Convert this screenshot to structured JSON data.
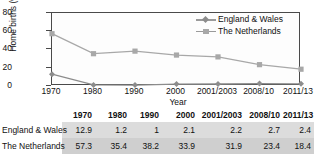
{
  "chart_data": {
    "type": "line",
    "title": "",
    "xlabel": "Year",
    "ylabel": "Home births (%)",
    "categories": [
      "1970",
      "1980",
      "1990",
      "2000",
      "2001/2003",
      "2008/10",
      "2011/13"
    ],
    "ylim": [
      0,
      80
    ],
    "yticks": [
      "0",
      "20",
      "40",
      "60",
      "80"
    ],
    "grid": false,
    "legend_position": "top-right",
    "series": [
      {
        "name": "England & Wales",
        "marker": "diamond",
        "color": "#8c8c8c",
        "values": [
          12.9,
          1.2,
          1,
          2.1,
          2.2,
          2.7,
          2.4
        ]
      },
      {
        "name": "The Netherlands",
        "marker": "square",
        "color": "#a8a8a8",
        "values": [
          57.3,
          35.4,
          38.2,
          33.9,
          31.9,
          23.4,
          18.4
        ]
      }
    ]
  },
  "legend": {
    "items": [
      {
        "label": "England & Wales"
      },
      {
        "label": "The Netherlands"
      }
    ]
  },
  "table": {
    "columns": [
      "1970",
      "1980",
      "1990",
      "2000",
      "2001/2003",
      "2008/10",
      "2011/13"
    ],
    "rows": [
      {
        "label": "England & Wales",
        "values": [
          "12.9",
          "1.2",
          "1",
          "2.1",
          "2.2",
          "2.7",
          "2.4"
        ]
      },
      {
        "label": "The Netherlands",
        "values": [
          "57.3",
          "35.4",
          "38.2",
          "33.9",
          "31.9",
          "23.4",
          "18.4"
        ]
      }
    ]
  }
}
